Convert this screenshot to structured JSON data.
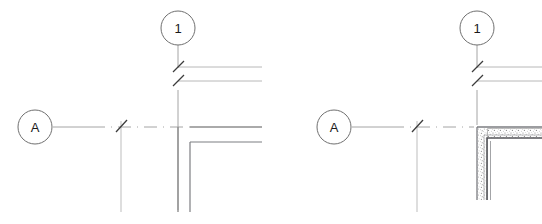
{
  "drawing": {
    "type": "architectural-plan-detail",
    "title": "Wall corner plan detail with grid bubbles",
    "background_color": "#ffffff",
    "canvas": {
      "width": 542,
      "height": 224
    },
    "line_colors": {
      "grid_line": "#9a9a9a",
      "grid_bubble": "#6f6f6f",
      "dimension_line": "#b0b0b0",
      "extension_line": "#b5b5b5",
      "tick_mark": "#3c3c3c",
      "wall_heavy": "#55565a",
      "wall_thin": "#7d7e82",
      "hatch": "#8c8c8c",
      "label_text": "#1a1a1a"
    },
    "figures": [
      {
        "id": "left-figure",
        "name": "unhatched-wall-corner",
        "bubbles": [
          {
            "id": "left-vertical-grid",
            "label": "1",
            "cx": 178,
            "cy": 28,
            "r": 17,
            "orientation": "top"
          },
          {
            "id": "left-horizontal-grid",
            "label": "A",
            "cx": 35,
            "cy": 127,
            "r": 17,
            "orientation": "left"
          }
        ],
        "dimension_rows": 2,
        "tick_marks": 3,
        "wall_hatched": false
      },
      {
        "id": "right-figure",
        "name": "hatched-wall-corner",
        "bubbles": [
          {
            "id": "right-vertical-grid",
            "label": "1",
            "cx": 477,
            "cy": 28,
            "r": 17,
            "orientation": "top"
          },
          {
            "id": "right-horizontal-grid",
            "label": "A",
            "cx": 334,
            "cy": 127,
            "r": 17,
            "orientation": "left"
          }
        ],
        "dimension_rows": 2,
        "tick_marks": 3,
        "wall_hatched": true
      }
    ]
  }
}
